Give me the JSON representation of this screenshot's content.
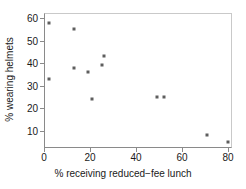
{
  "chart_data": {
    "type": "scatter",
    "title": "",
    "xlabel": "% receiving reduced−fee lunch",
    "ylabel": "% wearing helmets",
    "xlim": [
      0,
      83
    ],
    "ylim": [
      0,
      61
    ],
    "xticks": [
      0,
      20,
      40,
      60,
      80
    ],
    "yticks": [
      10,
      20,
      30,
      40,
      50,
      60
    ],
    "xticklabels": [
      "0",
      "20",
      "40",
      "60",
      "80"
    ],
    "yticklabels": [
      "10",
      "20",
      "30",
      "40",
      "50",
      "60"
    ],
    "grid": false,
    "legend": null,
    "marker_color": "#5e5e5e",
    "axis_color": "#8a8a8a",
    "points": [
      {
        "x": 2,
        "y": 58
      },
      {
        "x": 13,
        "y": 55
      },
      {
        "x": 2,
        "y": 33
      },
      {
        "x": 13,
        "y": 38
      },
      {
        "x": 19,
        "y": 36
      },
      {
        "x": 25,
        "y": 39
      },
      {
        "x": 26,
        "y": 43
      },
      {
        "x": 21,
        "y": 24
      },
      {
        "x": 49,
        "y": 25
      },
      {
        "x": 52,
        "y": 25
      },
      {
        "x": 71,
        "y": 8
      },
      {
        "x": 80,
        "y": 5
      }
    ]
  }
}
